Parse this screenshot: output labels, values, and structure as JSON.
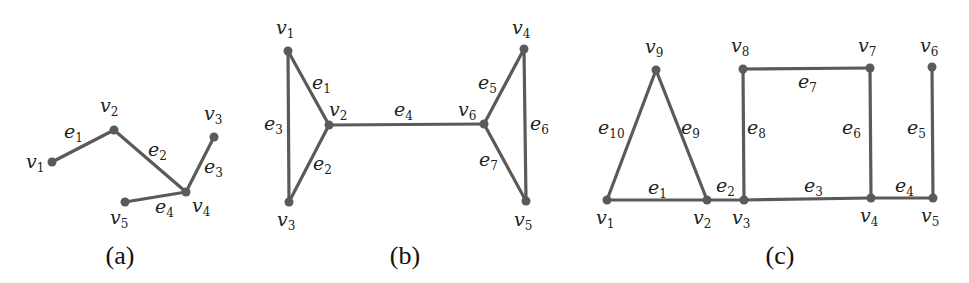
{
  "figure": {
    "panels": [
      {
        "id": "a",
        "caption": "(a)",
        "caption_pos": [
          120,
          264
        ],
        "nodes": [
          {
            "name": "v",
            "sub": "1",
            "x": 52,
            "y": 162,
            "lx": 26,
            "ly": 168
          },
          {
            "name": "v",
            "sub": "2",
            "x": 114,
            "y": 130,
            "lx": 100,
            "ly": 112
          },
          {
            "name": "v",
            "sub": "3",
            "x": 214,
            "y": 137,
            "lx": 204,
            "ly": 120
          },
          {
            "name": "v",
            "sub": "4",
            "x": 186,
            "y": 192,
            "lx": 192,
            "ly": 212
          },
          {
            "name": "v",
            "sub": "5",
            "x": 125,
            "y": 202,
            "lx": 110,
            "ly": 224
          }
        ],
        "edges": [
          {
            "name": "e",
            "sub": "1",
            "from": 0,
            "to": 1,
            "lx": 64,
            "ly": 138
          },
          {
            "name": "e",
            "sub": "2",
            "from": 1,
            "to": 3,
            "lx": 148,
            "ly": 156
          },
          {
            "name": "e",
            "sub": "3",
            "from": 2,
            "to": 3,
            "lx": 204,
            "ly": 173
          },
          {
            "name": "e",
            "sub": "4",
            "from": 4,
            "to": 3,
            "lx": 155,
            "ly": 213
          }
        ]
      },
      {
        "id": "b",
        "caption": "(b)",
        "caption_pos": [
          405,
          264
        ],
        "nodes": [
          {
            "name": "v",
            "sub": "1",
            "x": 288,
            "y": 51,
            "lx": 276,
            "ly": 34
          },
          {
            "name": "v",
            "sub": "2",
            "x": 329,
            "y": 125,
            "lx": 329,
            "ly": 116
          },
          {
            "name": "v",
            "sub": "3",
            "x": 289,
            "y": 202,
            "lx": 277,
            "ly": 226
          },
          {
            "name": "v",
            "sub": "4",
            "x": 524,
            "y": 49,
            "lx": 512,
            "ly": 34
          },
          {
            "name": "v",
            "sub": "5",
            "x": 526,
            "y": 201,
            "lx": 514,
            "ly": 226
          },
          {
            "name": "v",
            "sub": "6",
            "x": 484,
            "y": 124,
            "lx": 458,
            "ly": 116
          }
        ],
        "edges": [
          {
            "name": "e",
            "sub": "1",
            "from": 0,
            "to": 1,
            "lx": 312,
            "ly": 89
          },
          {
            "name": "e",
            "sub": "2",
            "from": 1,
            "to": 2,
            "lx": 313,
            "ly": 170
          },
          {
            "name": "e",
            "sub": "3",
            "from": 0,
            "to": 2,
            "lx": 264,
            "ly": 130
          },
          {
            "name": "e",
            "sub": "4",
            "from": 1,
            "to": 5,
            "lx": 394,
            "ly": 116
          },
          {
            "name": "e",
            "sub": "5",
            "from": 5,
            "to": 3,
            "lx": 478,
            "ly": 89
          },
          {
            "name": "e",
            "sub": "6",
            "from": 3,
            "to": 4,
            "lx": 530,
            "ly": 130
          },
          {
            "name": "e",
            "sub": "7",
            "from": 5,
            "to": 4,
            "lx": 479,
            "ly": 166
          }
        ]
      },
      {
        "id": "c",
        "caption": "(c)",
        "caption_pos": [
          780,
          264
        ],
        "nodes": [
          {
            "name": "v",
            "sub": "1",
            "x": 607,
            "y": 200,
            "lx": 596,
            "ly": 224
          },
          {
            "name": "v",
            "sub": "2",
            "x": 707,
            "y": 200,
            "lx": 693,
            "ly": 224
          },
          {
            "name": "v",
            "sub": "3",
            "x": 744,
            "y": 200,
            "lx": 732,
            "ly": 224
          },
          {
            "name": "v",
            "sub": "4",
            "x": 871,
            "y": 198,
            "lx": 860,
            "ly": 222
          },
          {
            "name": "v",
            "sub": "5",
            "x": 933,
            "y": 198,
            "lx": 921,
            "ly": 222
          },
          {
            "name": "v",
            "sub": "6",
            "x": 932,
            "y": 67,
            "lx": 920,
            "ly": 52
          },
          {
            "name": "v",
            "sub": "7",
            "x": 870,
            "y": 68,
            "lx": 858,
            "ly": 52
          },
          {
            "name": "v",
            "sub": "8",
            "x": 743,
            "y": 69,
            "lx": 731,
            "ly": 52
          },
          {
            "name": "v",
            "sub": "9",
            "x": 656,
            "y": 70,
            "lx": 645,
            "ly": 53
          }
        ],
        "edges": [
          {
            "name": "e",
            "sub": "1",
            "from": 0,
            "to": 1,
            "lx": 648,
            "ly": 194
          },
          {
            "name": "e",
            "sub": "2",
            "from": 1,
            "to": 2,
            "lx": 716,
            "ly": 192
          },
          {
            "name": "e",
            "sub": "3",
            "from": 2,
            "to": 3,
            "lx": 804,
            "ly": 192
          },
          {
            "name": "e",
            "sub": "4",
            "from": 3,
            "to": 4,
            "lx": 895,
            "ly": 192
          },
          {
            "name": "e",
            "sub": "5",
            "from": 5,
            "to": 4,
            "lx": 907,
            "ly": 134
          },
          {
            "name": "e",
            "sub": "6",
            "from": 6,
            "to": 3,
            "lx": 842,
            "ly": 134
          },
          {
            "name": "e",
            "sub": "7",
            "from": 7,
            "to": 6,
            "lx": 798,
            "ly": 88
          },
          {
            "name": "e",
            "sub": "8",
            "from": 7,
            "to": 2,
            "lx": 747,
            "ly": 134
          },
          {
            "name": "e",
            "sub": "9",
            "from": 8,
            "to": 1,
            "lx": 681,
            "ly": 134
          },
          {
            "name": "e",
            "sub": "10",
            "from": 8,
            "to": 0,
            "lx": 598,
            "ly": 134
          }
        ]
      }
    ],
    "colors": {
      "edge": "#5a5a5a",
      "node": "#5a5a5a",
      "text": "#222222"
    }
  }
}
